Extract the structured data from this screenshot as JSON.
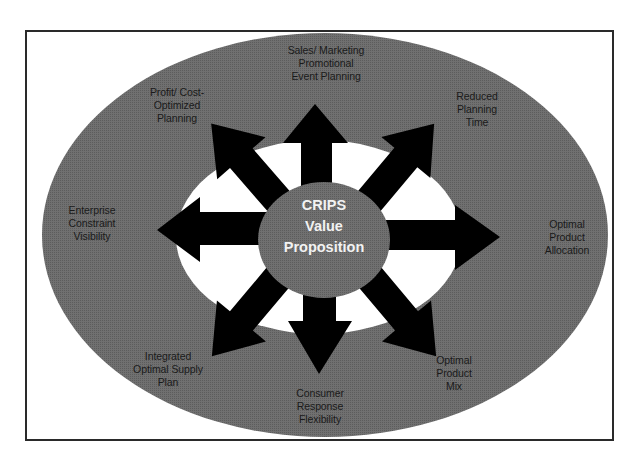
{
  "diagram": {
    "center": {
      "line1": "CRIPS",
      "line2": "Value",
      "line3": "Proposition"
    },
    "labels": {
      "top": {
        "line1": "Sales/ Marketing",
        "line2": "Promotional",
        "line3": "Event Planning"
      },
      "top_left": {
        "line1": "Profit/ Cost-",
        "line2": "Optimized",
        "line3": "Planning"
      },
      "top_right": {
        "line1": "Reduced",
        "line2": "Planning",
        "line3": "Time"
      },
      "left": {
        "line1": "Enterprise",
        "line2": "Constraint",
        "line3": "Visibility"
      },
      "right": {
        "line1": "Optimal",
        "line2": "Product",
        "line3": "Allocation"
      },
      "bottom_left": {
        "line1": "Integrated",
        "line2": "Optimal Supply",
        "line3": "Plan"
      },
      "bottom": {
        "line1": "Consumer",
        "line2": "Response",
        "line3": "Flexibility"
      },
      "bottom_right": {
        "line1": "Optimal",
        "line2": "Product",
        "line3": "Mix"
      }
    },
    "colors": {
      "outer_ellipse": "#6e6e6e",
      "inner_ellipse": "#ffffff",
      "center_oval": "#6a6a6a",
      "arrows": "#000000",
      "frame_border": "#2a2a2a",
      "center_text": "#f2f2f2",
      "label_text": "#1a1a1a"
    },
    "arrow_directions": [
      "up",
      "up-right",
      "right",
      "down-right",
      "down",
      "down-left",
      "left",
      "up-left"
    ]
  }
}
